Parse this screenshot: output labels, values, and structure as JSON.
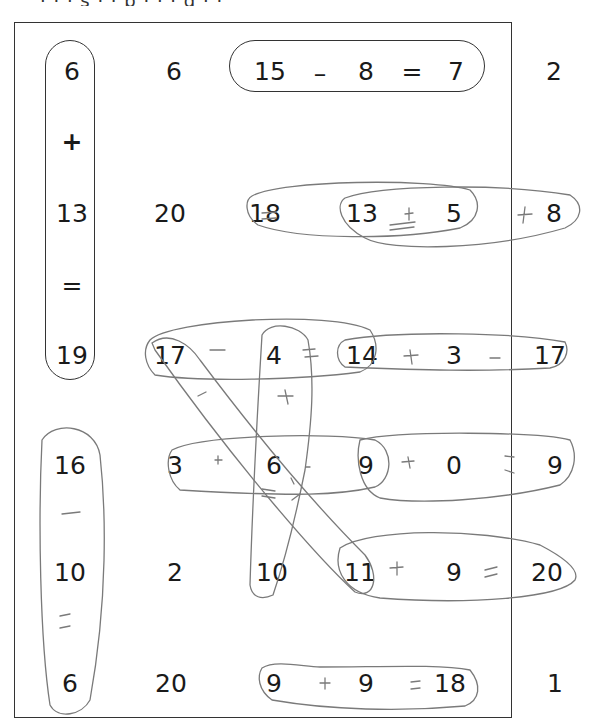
{
  "header": {
    "partial_text": "· · · s · · p · · · g · ·"
  },
  "worksheet": {
    "instructions": "",
    "grid": [
      {
        "row": 1,
        "cells": [
          "6",
          "6",
          "15",
          "–",
          "8",
          "=",
          "7",
          "2"
        ]
      },
      {
        "row": 2,
        "cells": [
          "+"
        ]
      },
      {
        "row": 3,
        "cells": [
          "13",
          "20",
          "18",
          "13",
          "5",
          "8"
        ]
      },
      {
        "row": 4,
        "cells": [
          "="
        ]
      },
      {
        "row": 5,
        "cells": [
          "19",
          "17",
          "4",
          "14",
          "3",
          "17"
        ]
      },
      {
        "row": 6,
        "cells": [
          "16",
          "3",
          "6",
          "9",
          "0",
          "9"
        ]
      },
      {
        "row": 7,
        "cells": [
          "–"
        ]
      },
      {
        "row": 8,
        "cells": [
          "10",
          "2",
          "10",
          "11",
          "9",
          "20"
        ]
      },
      {
        "row": 9,
        "cells": [
          "="
        ]
      },
      {
        "row": 10,
        "cells": [
          "6",
          "20",
          "9",
          "9",
          "18",
          "1"
        ]
      }
    ],
    "printed_examples": [
      {
        "equation": "6 + 13 = 19",
        "direction": "vertical"
      },
      {
        "equation": "15 – 8 = 7",
        "direction": "horizontal"
      }
    ],
    "handwritten_answers": [
      {
        "equation": "18 = 13 + 5"
      },
      {
        "equation": "13 + 5 = 18"
      },
      {
        "equation": "17 – 4 = 13"
      },
      {
        "equation": "14 + 3 = 17"
      },
      {
        "equation": "4 + 6 = 10"
      },
      {
        "equation": "3 + 6 = 9"
      },
      {
        "equation": "9 + 0 = 9"
      },
      {
        "equation": "11 + 9 = 20"
      },
      {
        "equation": "16 – 10 = 6"
      },
      {
        "equation": "9 + 9 = 18"
      },
      {
        "equation": "17 – 6 = 11 (diagonal)"
      }
    ],
    "labels": {
      "r1c1": "6",
      "r1c2": "6",
      "r1c3": "15",
      "r1op1": "–",
      "r1c4": "8",
      "r1op2": "=",
      "r1c5": "7",
      "r1c6": "2",
      "r2op": "+",
      "r3c1": "13",
      "r3c2": "20",
      "r3c3": "18",
      "r3c4": "13",
      "r3c5": "5",
      "r3c6": "8",
      "r4op": "=",
      "r5c1": "19",
      "r5c2": "17",
      "r5c3": "4",
      "r5c4": "14",
      "r5c5": "3",
      "r5c6": "17",
      "r6c1": "16",
      "r6c2": "3",
      "r6c3": "6",
      "r6c4": "9",
      "r6c5": "0",
      "r6c6": "9",
      "r7op": "–",
      "r8c1": "10",
      "r8c2": "2",
      "r8c3": "10",
      "r8c4": "11",
      "r8c5": "9",
      "r8c6": "20",
      "r9op": "=",
      "r10c1": "6",
      "r10c2": "20",
      "r10c3": "9",
      "r10c4": "9",
      "r10c5": "18",
      "r10c6": "1"
    },
    "ink": {
      "r3_signs": [
        "=",
        "+",
        "=",
        "+"
      ],
      "r5_signs": [
        "–",
        "=",
        "+",
        "–"
      ],
      "r6_signs": [
        "+",
        "=",
        "+",
        "="
      ],
      "r8_signs": [
        "+",
        "="
      ],
      "r10_signs": [
        "+",
        "="
      ],
      "col_signs": [
        "+",
        "=",
        "–",
        "="
      ]
    },
    "colors": {
      "print": "#1a1a1a",
      "pencil": "#777777",
      "frame": "#333333"
    }
  }
}
